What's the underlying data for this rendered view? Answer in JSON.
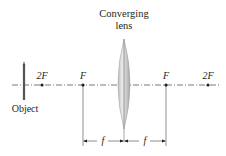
{
  "diagram": {
    "title_line1": "Converging",
    "title_line2": "lens",
    "object_label": "Object",
    "points": [
      {
        "id": "2F-left",
        "label": "2F"
      },
      {
        "id": "F-left",
        "label": "F"
      },
      {
        "id": "F-right",
        "label": "F"
      },
      {
        "id": "2F-right",
        "label": "2F"
      }
    ],
    "dimensions": [
      {
        "label": "f"
      },
      {
        "label": "f"
      }
    ],
    "colors": {
      "ink": "#231f20",
      "lens_fill": "#d8d8d8",
      "lens_edge": "#9a9a9a",
      "object": "#555555"
    }
  }
}
